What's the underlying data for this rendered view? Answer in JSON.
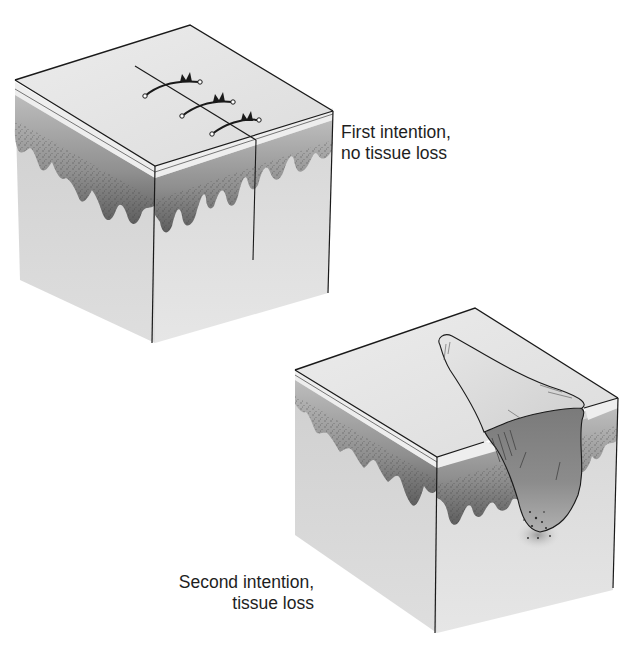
{
  "figure": {
    "panels": [
      {
        "id": "first-intention",
        "label_lines": [
          "First intention,",
          "no tissue loss"
        ],
        "features": [
          "skin block",
          "epidermis layer",
          "dermal papillae",
          "linear incision",
          "3 sutures"
        ]
      },
      {
        "id": "second-intention",
        "label_lines": [
          "Second intention,",
          "tissue loss"
        ],
        "features": [
          "skin block",
          "epidermis layer",
          "dermal papillae",
          "open wound crater"
        ]
      }
    ],
    "colors": {
      "background": "#ffffff",
      "top_face": "#e4e4e4",
      "side_face": "#d2d2d2",
      "epidermis_band": "#ececec",
      "dermis_dark": "#6a6a6a",
      "wound_interior": "#8a8a8a",
      "wound_flap": "#d8d8d8",
      "outline": "#1a1a1a",
      "text": "#1e1e1e"
    }
  }
}
